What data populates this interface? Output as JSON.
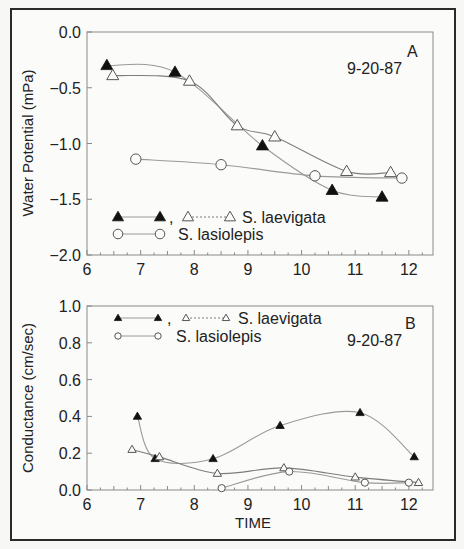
{
  "chart_data": [
    {
      "panel": "A",
      "type": "line",
      "annotation_letter": "A",
      "annotation_date": "9-20-87",
      "xlabel": "",
      "ylabel": "Water Potential (mPa)",
      "xlim": [
        6,
        12.45
      ],
      "ylim": [
        -2.0,
        0.0
      ],
      "xticks": [
        "6",
        "7",
        "8",
        "9",
        "10",
        "11",
        "12"
      ],
      "yticks": [
        "0.0",
        "-0.5",
        "-1.0",
        "-1.5",
        "-2.0"
      ],
      "grid": false,
      "legend": {
        "position": "lower-left",
        "row1": {
          "sep": ",",
          "label": "S. laevigata"
        },
        "row2": {
          "label": "S. lasiolepis"
        }
      },
      "series": [
        {
          "name": "S. laevigata (filled)",
          "marker": "filled-triangle",
          "line": "solid",
          "x": [
            6.37,
            7.64,
            9.27,
            10.57,
            11.5
          ],
          "y": [
            -0.3,
            -0.36,
            -1.02,
            -1.42,
            -1.48
          ]
        },
        {
          "name": "S. laevigata (open)",
          "marker": "open-triangle",
          "line": "dotted",
          "x": [
            6.48,
            7.91,
            8.8,
            9.5,
            10.84,
            11.66
          ],
          "y": [
            -0.39,
            -0.44,
            -0.84,
            -0.94,
            -1.25,
            -1.26
          ]
        },
        {
          "name": "S. lasiolepis",
          "marker": "open-circle",
          "line": "solid",
          "x": [
            6.91,
            8.5,
            10.25,
            11.87
          ],
          "y": [
            -1.14,
            -1.19,
            -1.29,
            -1.31
          ]
        }
      ]
    },
    {
      "panel": "B",
      "type": "line",
      "annotation_letter": "B",
      "annotation_date": "9-20-87",
      "xlabel": "TIME",
      "ylabel": "Conductance (cm/sec)",
      "xlim": [
        6,
        12.45
      ],
      "ylim": [
        0.0,
        1.0
      ],
      "xticks": [
        "6",
        "7",
        "8",
        "9",
        "10",
        "11",
        "12"
      ],
      "yticks": [
        "1.0",
        "0.8",
        "0.6",
        "0.4",
        "0.2",
        "0.0"
      ],
      "grid": false,
      "legend": {
        "position": "upper-left",
        "row1": {
          "sep": ",",
          "label": "S. laevigata"
        },
        "row2": {
          "label": "S. lasiolepis"
        }
      },
      "series": [
        {
          "name": "S. laevigata (filled)",
          "marker": "filled-triangle",
          "line": "solid",
          "x": [
            6.94,
            7.27,
            8.35,
            9.6,
            11.09,
            12.1
          ],
          "y": [
            0.4,
            0.17,
            0.17,
            0.35,
            0.42,
            0.18
          ]
        },
        {
          "name": "S. laevigata (open)",
          "marker": "open-triangle",
          "line": "dotted",
          "x": [
            6.84,
            7.35,
            8.43,
            9.67,
            11.0,
            12.18
          ],
          "y": [
            0.22,
            0.18,
            0.09,
            0.12,
            0.07,
            0.04
          ]
        },
        {
          "name": "S. lasiolepis",
          "marker": "open-circle",
          "line": "solid",
          "x": [
            8.51,
            9.77,
            11.18,
            12.0
          ],
          "y": [
            0.01,
            0.1,
            0.04,
            0.04
          ]
        }
      ]
    }
  ],
  "colors": {
    "ink": "#222222",
    "curve": "#9a9a9a",
    "frame": "#2a2a2a",
    "axis": "#8a8a8a"
  }
}
